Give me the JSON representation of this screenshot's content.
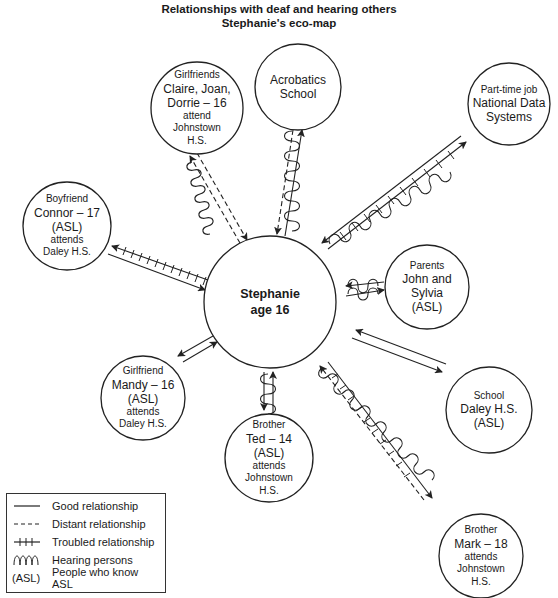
{
  "title": {
    "line1": "Relationships with deaf and hearing others",
    "line2": "Stephanie's eco-map"
  },
  "center": {
    "name": "Stephanie",
    "age": "age 16"
  },
  "nodes": [
    {
      "id": "girlfriends",
      "lines": [
        "Girlfriends",
        "Claire, Joan,",
        "Dorrie – 16",
        "attend",
        "Johnstown",
        "H.S."
      ],
      "relationship": "distant",
      "hearing": true,
      "asl": false
    },
    {
      "id": "acrobatics",
      "lines": [
        "Acrobatics",
        "School"
      ],
      "relationship": "good/distant",
      "hearing": true,
      "asl": false
    },
    {
      "id": "job",
      "lines": [
        "Part-time job",
        "National Data",
        "Systems"
      ],
      "relationship": "good/troubled",
      "hearing": true,
      "asl": false
    },
    {
      "id": "boyfriend",
      "lines": [
        "Boyfriend",
        "Connor – 17",
        "(ASL)",
        "attends",
        "Daley H.S."
      ],
      "relationship": "troubled",
      "hearing": false,
      "asl": true
    },
    {
      "id": "parents",
      "lines": [
        "Parents",
        "John and",
        "Sylvia",
        "(ASL)"
      ],
      "relationship": "good",
      "hearing": true,
      "asl": true
    },
    {
      "id": "mandy",
      "lines": [
        "Girlfriend",
        "Mandy – 16",
        "(ASL)",
        "attends",
        "Daley H.S."
      ],
      "relationship": "good",
      "hearing": false,
      "asl": true
    },
    {
      "id": "school",
      "lines": [
        "School",
        "Daley H.S.",
        "(ASL)"
      ],
      "relationship": "good",
      "hearing": false,
      "asl": true
    },
    {
      "id": "ted",
      "lines": [
        "Brother",
        "Ted – 14",
        "(ASL)",
        "attends",
        "Johnstown",
        "H.S."
      ],
      "relationship": "good",
      "hearing": true,
      "asl": true
    },
    {
      "id": "mark",
      "lines": [
        "Brother",
        "Mark – 18",
        "attends",
        "Johnstown",
        "H.S."
      ],
      "relationship": "distant/troubled",
      "hearing": true,
      "asl": false
    }
  ],
  "legend": {
    "items": [
      {
        "symbol": "solid",
        "label": "Good relationship"
      },
      {
        "symbol": "dashed",
        "label": "Distant relationship"
      },
      {
        "symbol": "hatched",
        "label": "Troubled relationship"
      },
      {
        "symbol": "wave",
        "label": "Hearing persons"
      },
      {
        "symbol": "(ASL)",
        "label": "People who know ASL"
      }
    ]
  }
}
